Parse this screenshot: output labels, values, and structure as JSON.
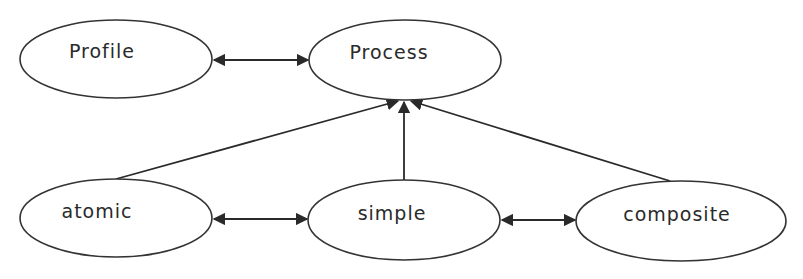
{
  "diagram": {
    "nodes": [
      {
        "id": "profile",
        "label": "Profile",
        "cx": 116,
        "cy": 59,
        "rx": 96,
        "ry": 39
      },
      {
        "id": "process",
        "label": "Process",
        "cx": 405,
        "cy": 60,
        "rx": 96,
        "ry": 40
      },
      {
        "id": "atomic",
        "label": "atomic",
        "cx": 116,
        "cy": 218,
        "rx": 96,
        "ry": 39
      },
      {
        "id": "simple",
        "label": "simple",
        "cx": 404,
        "cy": 220,
        "rx": 96,
        "ry": 40
      },
      {
        "id": "composite",
        "label": "composite",
        "cx": 681,
        "cy": 221,
        "rx": 105,
        "ry": 40
      }
    ],
    "edges": [
      {
        "from": "profile",
        "to": "process",
        "type": "bidirectional"
      },
      {
        "from": "atomic",
        "to": "simple",
        "type": "bidirectional"
      },
      {
        "from": "simple",
        "to": "composite",
        "type": "bidirectional"
      },
      {
        "from": "atomic",
        "to": "process",
        "type": "directed"
      },
      {
        "from": "simple",
        "to": "process",
        "type": "directed"
      },
      {
        "from": "composite",
        "to": "process",
        "type": "directed"
      }
    ]
  }
}
